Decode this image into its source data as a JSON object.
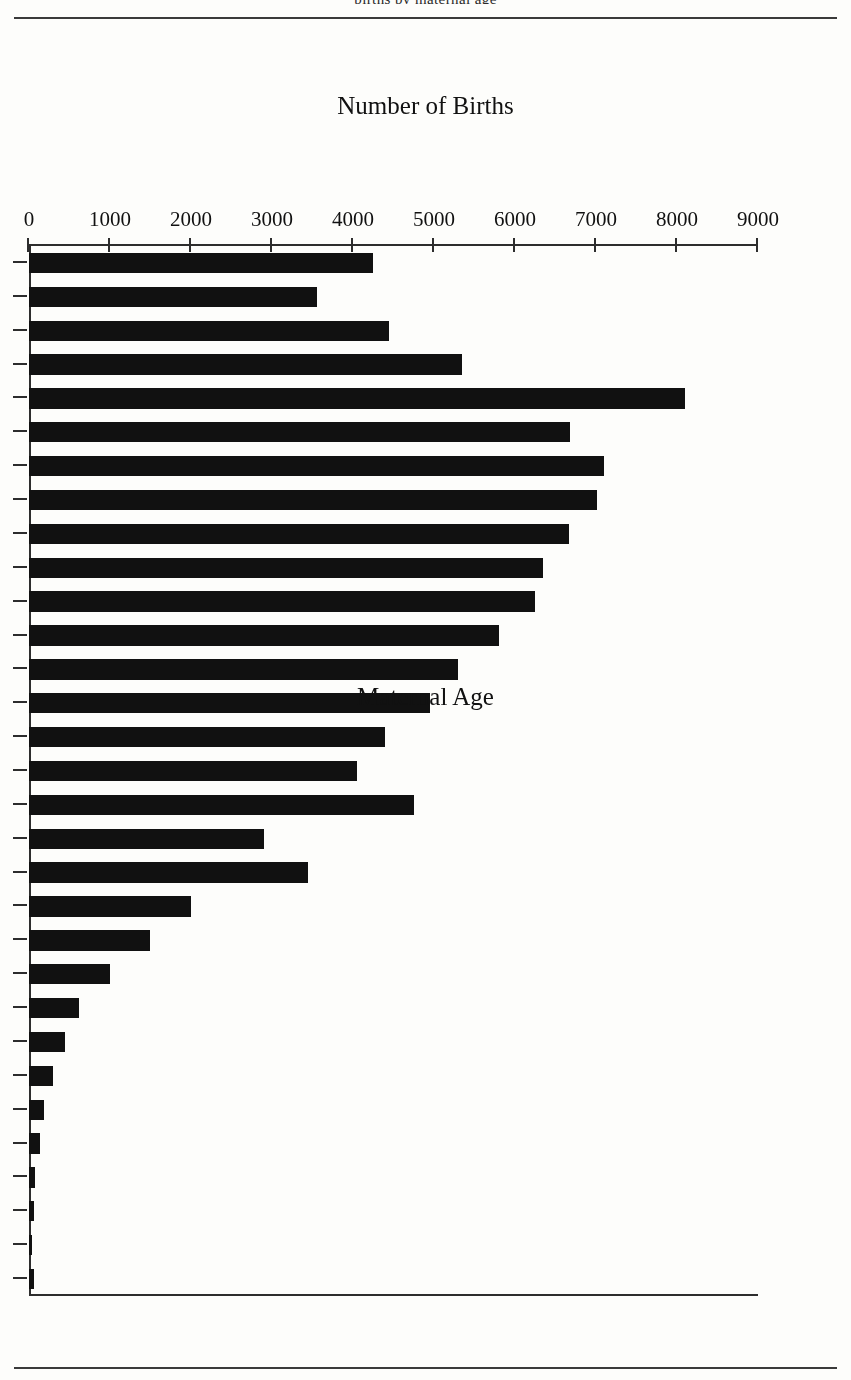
{
  "page": {
    "running_head_clipped": "births by maternal age"
  },
  "chart_data": {
    "type": "bar",
    "orientation": "horizontal",
    "title": "",
    "xlabel": "Maternal Age",
    "ylabel": "Number of Births",
    "categories": [
      19,
      20,
      21,
      22,
      23,
      24,
      25,
      26,
      27,
      28,
      29,
      30,
      31,
      32,
      33,
      34,
      35,
      36,
      37,
      38,
      39,
      40,
      41,
      42,
      43,
      44,
      45,
      46,
      47,
      48,
      49
    ],
    "values": [
      4250,
      3550,
      4450,
      5350,
      8100,
      6680,
      7100,
      7010,
      6670,
      6350,
      6250,
      5800,
      5300,
      4950,
      4400,
      4050,
      4750,
      2900,
      3450,
      2000,
      1500,
      1000,
      620,
      450,
      300,
      190,
      130,
      80,
      60,
      40,
      60
    ],
    "tick_labels_value_axis": [
      "9000",
      "8000",
      "7000",
      "6000",
      "5000",
      "4000",
      "3000",
      "2000",
      "1000",
      "0"
    ],
    "tick_values_value_axis": [
      9000,
      8000,
      7000,
      6000,
      5000,
      4000,
      3000,
      2000,
      1000,
      0
    ],
    "tick_labels_category_axis": [
      "19",
      "21",
      "23",
      "25",
      "27",
      "29",
      "31",
      "33",
      "35",
      "37",
      "39",
      "41",
      "43",
      "45",
      "47",
      "49"
    ],
    "ylim": [
      0,
      9000
    ],
    "grid": false,
    "legend": null,
    "bar_color": "#111111",
    "axis_color": "#2d2d2d",
    "page_rotation_degrees": 180
  }
}
